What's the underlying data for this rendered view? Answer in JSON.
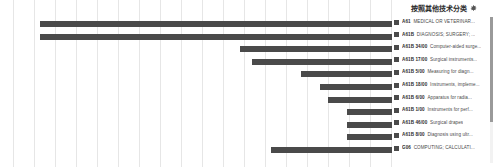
{
  "legend": {
    "title": "按照其他技术分类",
    "gear_icon": "gear-icon",
    "scrollbar": "vertical-scrollbar",
    "items": [
      {
        "code": "A61",
        "desc": "MEDICAL OR VETERINAR...",
        "color": "#4a4a4a"
      },
      {
        "code": "A61B",
        "desc": "DIAGNOSIS; SURGERY; ...",
        "color": "#4a4a4a"
      },
      {
        "code": "A61B 34/00",
        "desc": "Computer-aided surge...",
        "color": "#4a4a4a"
      },
      {
        "code": "A61B 17/00",
        "desc": "Surgical instruments...",
        "color": "#4a4a4a"
      },
      {
        "code": "A61B 5/00",
        "desc": "Measuring for diagn...",
        "color": "#4a4a4a"
      },
      {
        "code": "A61B 18/00",
        "desc": "Instruments, impleme...",
        "color": "#4a4a4a"
      },
      {
        "code": "A61B 6/00",
        "desc": "Apparatus for radia...",
        "color": "#4a4a4a"
      },
      {
        "code": "A61B 1/00",
        "desc": "Instruments for perf...",
        "color": "#4a4a4a"
      },
      {
        "code": "A61B 46/00",
        "desc": "Surgical drapes",
        "color": "#4a4a4a"
      },
      {
        "code": "A61B 8/00",
        "desc": "Diagnosis using ultr...",
        "color": "#4a4a4a"
      },
      {
        "code": "G06",
        "desc": "COMPUTING; CALCULATI...",
        "color": "#4a4a4a"
      }
    ]
  },
  "chart_data": {
    "type": "bar",
    "orientation": "horizontal",
    "title": "按照其他技术分类",
    "xlabel": "",
    "ylabel": "",
    "grid": true,
    "grid_axis": "x",
    "gridline_count": 19,
    "legend_position": "right",
    "bar_color": "#4a4a4a",
    "categories": [
      "A61",
      "A61B",
      "A61B 34/00",
      "A61B 17/00",
      "A61B 5/00",
      "A61B 18/00",
      "A61B 6/00",
      "A61B 1/00",
      "A61B 46/00",
      "A61B 8/00",
      "G06"
    ],
    "values": [
      98,
      96,
      33,
      30,
      18,
      13,
      11,
      6,
      6,
      6,
      25
    ],
    "bar_start_fraction": [
      0.07,
      0.07,
      0.6,
      0.63,
      0.76,
      0.81,
      0.83,
      0.88,
      0.88,
      0.88,
      0.68
    ],
    "bar_end_fraction": [
      1.0,
      1.0,
      1.0,
      1.0,
      1.0,
      1.0,
      1.0,
      1.0,
      1.0,
      1.0,
      1.0
    ],
    "xlim": [
      0,
      100
    ],
    "ylim": null
  }
}
